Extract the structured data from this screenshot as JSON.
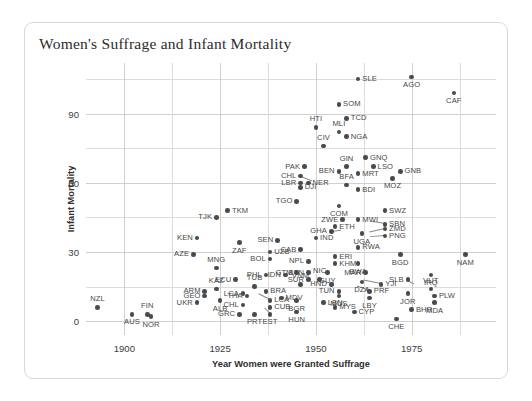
{
  "card": {
    "title": "Women's Suffrage and Infant Mortality"
  },
  "chart_data": {
    "type": "scatter",
    "title": "Women's Suffrage and Infant Mortality",
    "xlabel": "Year Women were Granted Suffrage",
    "ylabel": "Infant Mortality",
    "xlim": [
      1890,
      1997
    ],
    "ylim": [
      -6,
      112
    ],
    "xticks": [
      1900,
      1925,
      1950,
      1975
    ],
    "yticks": [
      0,
      30,
      60,
      90
    ],
    "xgrid_minor": [
      1900,
      1912.5,
      1925,
      1937.5,
      1950,
      1962.5,
      1975,
      1987.5
    ],
    "ygrid_minor": [
      0,
      15,
      30,
      45,
      60,
      75,
      90,
      105
    ],
    "grid": true,
    "legend": null,
    "marker_color": "#4a4a4a",
    "points": [
      {
        "label": "NZL",
        "x": 1893,
        "y": 6,
        "pos": "t"
      },
      {
        "label": "AUS",
        "x": 1902,
        "y": 3,
        "pos": "b"
      },
      {
        "label": "FIN",
        "x": 1906,
        "y": 3,
        "pos": "t"
      },
      {
        "label": "NOR",
        "x": 1907,
        "y": 2,
        "pos": "b"
      },
      {
        "label": "KEN",
        "x": 1919,
        "y": 36,
        "pos": "l"
      },
      {
        "label": "AZE",
        "x": 1918,
        "y": 29,
        "pos": "l"
      },
      {
        "label": "TJK",
        "x": 1924,
        "y": 45,
        "pos": "l"
      },
      {
        "label": "TKM",
        "x": 1927,
        "y": 48,
        "pos": "r"
      },
      {
        "label": "ZAF",
        "x": 1930,
        "y": 34,
        "pos": "b"
      },
      {
        "label": "MNG",
        "x": 1924,
        "y": 23,
        "pos": "t"
      },
      {
        "label": "ECU",
        "x": 1929,
        "y": 18,
        "pos": "l"
      },
      {
        "label": "ARM",
        "x": 1921,
        "y": 13,
        "pos": "l"
      },
      {
        "label": "KAZ",
        "x": 1924,
        "y": 14,
        "pos": "t"
      },
      {
        "label": "GEO",
        "x": 1921,
        "y": 11,
        "pos": "l"
      },
      {
        "label": "UKR",
        "x": 1919,
        "y": 8,
        "pos": "l"
      },
      {
        "label": "ALB",
        "x": 1925,
        "y": 9,
        "pos": "b"
      },
      {
        "label": "LCA",
        "x": 1931,
        "y": 12,
        "pos": "l"
      },
      {
        "label": "TUB",
        "x": 1934,
        "y": 15,
        "pos": "t"
      },
      {
        "label": "THA",
        "x": 1932,
        "y": 11,
        "pos": "l"
      },
      {
        "label": "CHL",
        "x": 1931,
        "y": 7,
        "pos": "l"
      },
      {
        "label": "GRC",
        "x": 1930,
        "y": 3,
        "pos": "l"
      },
      {
        "label": "PRT",
        "x": 1934,
        "y": 3,
        "pos": "b"
      },
      {
        "label": "EST",
        "x": 1938,
        "y": 3,
        "pos": "b"
      },
      {
        "label": "BRA",
        "x": 1937,
        "y": 13,
        "pos": "r"
      },
      {
        "label": "LCA",
        "x": 1938,
        "y": 9,
        "pos": "r"
      },
      {
        "label": "CUB",
        "x": 1938,
        "y": 6,
        "pos": "r"
      },
      {
        "label": "MDV",
        "x": 1941,
        "y": 10,
        "pos": "r"
      },
      {
        "label": "PHL",
        "x": 1937,
        "y": 20,
        "pos": "l"
      },
      {
        "label": "IDN",
        "x": 1942,
        "y": 20,
        "pos": "l"
      },
      {
        "label": "BOL",
        "x": 1938,
        "y": 27,
        "pos": "l"
      },
      {
        "label": "UZB",
        "x": 1938,
        "y": 30,
        "pos": "r"
      },
      {
        "label": "SEN",
        "x": 1940,
        "y": 35,
        "pos": "l"
      },
      {
        "label": "GTM",
        "x": 1945,
        "y": 21,
        "pos": "l"
      },
      {
        "label": "BTN",
        "x": 1948,
        "y": 21,
        "pos": "l"
      },
      {
        "label": "NPL",
        "x": 1948,
        "y": 26,
        "pos": "l"
      },
      {
        "label": "VNM",
        "x": 1946,
        "y": 16,
        "pos": "t"
      },
      {
        "label": "SUR",
        "x": 1948,
        "y": 18,
        "pos": "l"
      },
      {
        "label": "NIC",
        "x": 1951,
        "y": 18,
        "pos": "t"
      },
      {
        "label": "BGR",
        "x": 1945,
        "y": 9,
        "pos": "b"
      },
      {
        "label": "HND",
        "x": 1954,
        "y": 16,
        "pos": "l"
      },
      {
        "label": "TUN",
        "x": 1956,
        "y": 13,
        "pos": "l"
      },
      {
        "label": "MUS",
        "x": 1956,
        "y": 11,
        "pos": "b"
      },
      {
        "label": "LBN",
        "x": 1952,
        "y": 8,
        "pos": "r"
      },
      {
        "label": "MYS",
        "x": 1955,
        "y": 6,
        "pos": "r"
      },
      {
        "label": "HUN",
        "x": 1945,
        "y": 4,
        "pos": "b"
      },
      {
        "label": "CYP",
        "x": 1960,
        "y": 4,
        "pos": "r"
      },
      {
        "label": "GUY",
        "x": 1953,
        "y": 21,
        "pos": "b"
      },
      {
        "label": "CAB",
        "x": 1946,
        "y": 31,
        "pos": "l"
      },
      {
        "label": "ERI",
        "x": 1955,
        "y": 28,
        "pos": "r"
      },
      {
        "label": "KHM",
        "x": 1955,
        "y": 25,
        "pos": "r"
      },
      {
        "label": "BWA",
        "x": 1961,
        "y": 25,
        "pos": "b"
      },
      {
        "label": "RWA",
        "x": 1961,
        "y": 32,
        "pos": "r"
      },
      {
        "label": "IND",
        "x": 1950,
        "y": 36,
        "pos": "r"
      },
      {
        "label": "GHA",
        "x": 1954,
        "y": 39,
        "pos": "l"
      },
      {
        "label": "ETH",
        "x": 1955,
        "y": 41,
        "pos": "r"
      },
      {
        "label": "UGA",
        "x": 1962,
        "y": 38,
        "pos": "b"
      },
      {
        "label": "ZWE",
        "x": 1957,
        "y": 44,
        "pos": "l"
      },
      {
        "label": "COM",
        "x": 1956,
        "y": 50,
        "pos": "b"
      },
      {
        "label": "MWI",
        "x": 1961,
        "y": 44,
        "pos": "r"
      },
      {
        "label": "SBN",
        "x": 1968,
        "y": 42,
        "pos": "r"
      },
      {
        "label": "ZMD",
        "x": 1968,
        "y": 40,
        "pos": "r"
      },
      {
        "label": "PNG",
        "x": 1968,
        "y": 37,
        "pos": "r"
      },
      {
        "label": "SWZ",
        "x": 1968,
        "y": 48,
        "pos": "r"
      },
      {
        "label": "TGO",
        "x": 1945,
        "y": 52,
        "pos": "l"
      },
      {
        "label": "DJI",
        "x": 1946,
        "y": 58,
        "pos": "r"
      },
      {
        "label": "LBR",
        "x": 1946,
        "y": 60,
        "pos": "l"
      },
      {
        "label": "NER",
        "x": 1948,
        "y": 60,
        "pos": "r"
      },
      {
        "label": "CHL",
        "x": 1946,
        "y": 63,
        "pos": "l"
      },
      {
        "label": "BFA",
        "x": 1958,
        "y": 59,
        "pos": "t"
      },
      {
        "label": "BDI",
        "x": 1961,
        "y": 57,
        "pos": "r"
      },
      {
        "label": "BEN",
        "x": 1956,
        "y": 65,
        "pos": "l"
      },
      {
        "label": "GIN",
        "x": 1958,
        "y": 67,
        "pos": "t"
      },
      {
        "label": "MRT",
        "x": 1961,
        "y": 64,
        "pos": "r"
      },
      {
        "label": "PAK",
        "x": 1947,
        "y": 67,
        "pos": "l"
      },
      {
        "label": "CIV",
        "x": 1952,
        "y": 76,
        "pos": "t"
      },
      {
        "label": "MLI",
        "x": 1956,
        "y": 82,
        "pos": "t"
      },
      {
        "label": "NGA",
        "x": 1958,
        "y": 80,
        "pos": "r"
      },
      {
        "label": "HTI",
        "x": 1950,
        "y": 84,
        "pos": "t"
      },
      {
        "label": "GNQ",
        "x": 1963,
        "y": 71,
        "pos": "r"
      },
      {
        "label": "LSO",
        "x": 1965,
        "y": 67,
        "pos": "r"
      },
      {
        "label": "GNB",
        "x": 1972,
        "y": 65,
        "pos": "r"
      },
      {
        "label": "MOZ",
        "x": 1970,
        "y": 62,
        "pos": "b"
      },
      {
        "label": "TCD",
        "x": 1958,
        "y": 88,
        "pos": "r"
      },
      {
        "label": "SOM",
        "x": 1956,
        "y": 94,
        "pos": "r"
      },
      {
        "label": "SLE",
        "x": 1961,
        "y": 105,
        "pos": "r"
      },
      {
        "label": "AGO",
        "x": 1975,
        "y": 106,
        "pos": "b"
      },
      {
        "label": "CAF",
        "x": 1986,
        "y": 99,
        "pos": "b"
      },
      {
        "label": "BGD",
        "x": 1972,
        "y": 29,
        "pos": "b"
      },
      {
        "label": "NAM",
        "x": 1989,
        "y": 29,
        "pos": "b"
      },
      {
        "label": "MAR",
        "x": 1963,
        "y": 21,
        "pos": "l"
      },
      {
        "label": "DZA",
        "x": 1962,
        "y": 17,
        "pos": "b"
      },
      {
        "label": "SLB",
        "x": 1974,
        "y": 18,
        "pos": "l"
      },
      {
        "label": "IRQ",
        "x": 1980,
        "y": 20,
        "pos": "b"
      },
      {
        "label": "YJI",
        "x": 1967,
        "y": 16,
        "pos": "r"
      },
      {
        "label": "PRF",
        "x": 1964,
        "y": 13,
        "pos": "r"
      },
      {
        "label": "LBY",
        "x": 1964,
        "y": 10,
        "pos": "b"
      },
      {
        "label": "JOR",
        "x": 1974,
        "y": 12,
        "pos": "b"
      },
      {
        "label": "VUT",
        "x": 1980,
        "y": 14,
        "pos": "t"
      },
      {
        "label": "PLW",
        "x": 1981,
        "y": 11,
        "pos": "r"
      },
      {
        "label": "MDA",
        "x": 1981,
        "y": 8,
        "pos": "b"
      },
      {
        "label": "BHR",
        "x": 1975,
        "y": 5,
        "pos": "r"
      },
      {
        "label": "CHE",
        "x": 1971,
        "y": 1,
        "pos": "b"
      }
    ],
    "leaders": [
      {
        "from_label": "YJI",
        "x1": 1967,
        "y1": 16,
        "x2": 1962.5,
        "y2": 17.5
      },
      {
        "from_label": "PRF",
        "x1": 1964,
        "y1": 13,
        "x2": 1960.5,
        "y2": 15.0
      },
      {
        "from_label": "SBN",
        "x1": 1968,
        "y1": 42,
        "x2": 1964.5,
        "y2": 43.0
      },
      {
        "from_label": "ZMD",
        "x1": 1968,
        "y1": 40,
        "x2": 1964.0,
        "y2": 38.5
      },
      {
        "from_label": "PNG",
        "x1": 1968,
        "y1": 37,
        "x2": 1964.0,
        "y2": 36.5
      },
      {
        "from_label": "CHL",
        "x1": 1946,
        "y1": 63,
        "x2": 1949.0,
        "y2": 61.0
      },
      {
        "from_label": "LCA",
        "x1": 1938,
        "y1": 9,
        "x2": 1935.0,
        "y2": 11.5
      },
      {
        "from_label": "EST",
        "x1": 1938,
        "y1": 3,
        "x2": 1936.5,
        "y2": 5.5
      },
      {
        "from_label": "GHA",
        "x1": 1954,
        "y1": 39,
        "x2": 1956.5,
        "y2": 39.5
      },
      {
        "from_label": "SLB",
        "x1": 1974,
        "y1": 18,
        "x2": 1975.5,
        "y2": 16.5
      }
    ]
  }
}
